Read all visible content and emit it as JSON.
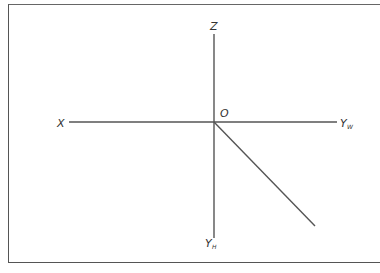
{
  "title": "",
  "diagram": {
    "type": "three-projection axes",
    "labels": {
      "z": "Z",
      "x": "X",
      "origin": "O",
      "yw_main": "Y",
      "yw_sub": "W",
      "yh_main": "Y",
      "yh_sub": "H"
    },
    "colors": {
      "line": "#555555",
      "label": "#333333",
      "frame": "#555555"
    }
  }
}
